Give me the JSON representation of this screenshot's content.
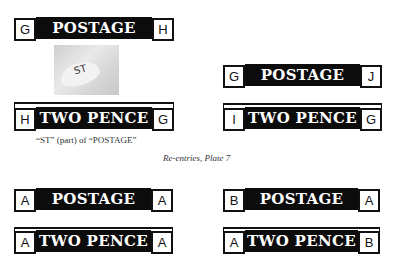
{
  "figures": {
    "top_left": {
      "top_panel": {
        "text": "POSTAGE",
        "left_letter": "G",
        "right_letter": "H"
      },
      "detail_image": {
        "label": "ST"
      },
      "bottom_panel": {
        "text": "TWO PENCE",
        "left_letter": "H",
        "right_letter": "G"
      },
      "caption": "“ST” (part) of “POSTAGE”"
    },
    "top_right": {
      "top_panel": {
        "text": "POSTAGE",
        "left_letter": "G",
        "right_letter": "J"
      },
      "bottom_panel": {
        "text": "TWO PENCE",
        "left_letter": "I",
        "right_letter": "G"
      }
    },
    "section_caption": "Re-entries, Plate 7",
    "bottom_left": {
      "top_panel": {
        "text": "POSTAGE",
        "left_letter": "A",
        "right_letter": "A"
      },
      "bottom_panel": {
        "text": "TWO PENCE",
        "left_letter": "A",
        "right_letter": "A"
      }
    },
    "bottom_right": {
      "top_panel": {
        "text": "POSTAGE",
        "left_letter": "B",
        "right_letter": "A"
      },
      "bottom_panel": {
        "text": "TWO PENCE",
        "left_letter": "A",
        "right_letter": "B"
      }
    }
  }
}
